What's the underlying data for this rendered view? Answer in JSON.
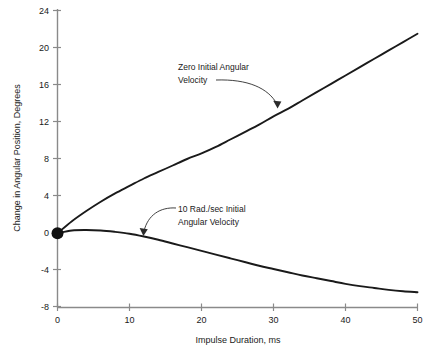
{
  "chart_data": {
    "type": "line",
    "title": "",
    "xlabel": "Impulse Duration, ms",
    "ylabel": "Change in Angular Position, Degrees",
    "xlim": [
      0,
      50
    ],
    "ylim": [
      -8,
      24
    ],
    "xticks": [
      0,
      10,
      20,
      30,
      40,
      50
    ],
    "yticks": [
      -8,
      -4,
      0,
      4,
      8,
      12,
      16,
      20,
      24
    ],
    "xtick_labels": [
      "0",
      "10",
      "20",
      "30",
      "40",
      "50"
    ],
    "ytick_labels": [
      "-8",
      "-4",
      "0",
      "4",
      "8",
      "12",
      "16",
      "20",
      "24"
    ],
    "grid": false,
    "legend": "none",
    "series": [
      {
        "name": "Zero Initial Angular Velocity",
        "x": [
          0,
          2,
          4,
          6,
          8,
          10,
          12,
          14,
          16,
          18,
          20,
          22,
          24,
          26,
          28,
          30,
          32,
          34,
          36,
          38,
          40,
          42,
          44,
          46,
          48,
          50
        ],
        "values": [
          0,
          1.3,
          2.4,
          3.4,
          4.3,
          5.1,
          5.9,
          6.6,
          7.3,
          8.0,
          8.6,
          9.3,
          10.1,
          10.9,
          11.7,
          12.6,
          13.4,
          14.3,
          15.2,
          16.1,
          17.0,
          17.9,
          18.8,
          19.7,
          20.6,
          21.5
        ]
      },
      {
        "name": "10 Rad./sec Initial Angular Velocity",
        "x": [
          0,
          2,
          4,
          6,
          8,
          10,
          12,
          14,
          16,
          18,
          20,
          22,
          24,
          26,
          28,
          30,
          32,
          34,
          36,
          38,
          40,
          42,
          44,
          46,
          48,
          50
        ],
        "values": [
          0,
          0.3,
          0.35,
          0.3,
          0.15,
          -0.05,
          -0.35,
          -0.7,
          -1.1,
          -1.5,
          -1.9,
          -2.3,
          -2.7,
          -3.1,
          -3.5,
          -3.85,
          -4.2,
          -4.55,
          -4.85,
          -5.15,
          -5.45,
          -5.7,
          -5.9,
          -6.1,
          -6.25,
          -6.35
        ]
      }
    ],
    "markers": [
      {
        "name": "origin-dot",
        "x": 0,
        "y": 0
      }
    ],
    "annotations": [
      {
        "name": "zero-initial-velocity-annotation",
        "line1": "Zero Initial Angular",
        "line2": "Velocity",
        "points_to_series": "Zero Initial Angular Velocity"
      },
      {
        "name": "ten-rad-per-sec-annotation",
        "line1": "10 Rad./sec Initial",
        "line2": "Angular Velocity",
        "points_to_series": "10 Rad./sec Initial Angular Velocity"
      }
    ],
    "colors": {
      "curve": "#1a1a1a",
      "axis": "#8a8a8a",
      "text": "#1a1a1a",
      "background": "#ffffff"
    }
  }
}
